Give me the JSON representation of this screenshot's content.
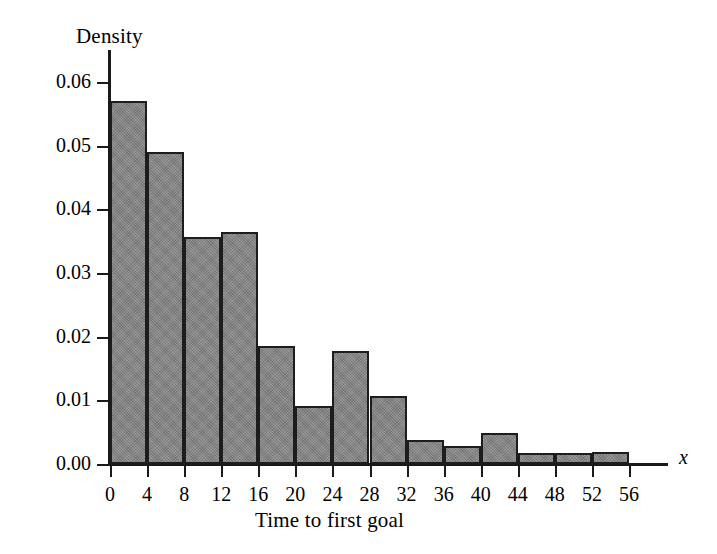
{
  "chart_data": {
    "type": "bar",
    "title": "",
    "xlabel": "Time to first goal",
    "ylabel": "Density",
    "x_axis_variable": "x",
    "bin_width": 4,
    "bin_edges": [
      0,
      4,
      8,
      12,
      16,
      20,
      24,
      28,
      32,
      36,
      40,
      44,
      48,
      52,
      56
    ],
    "categories": [
      "0-4",
      "4-8",
      "8-12",
      "12-16",
      "16-20",
      "20-24",
      "24-28",
      "28-32",
      "32-36",
      "36-40",
      "40-44",
      "44-48",
      "48-52",
      "52-56"
    ],
    "values": [
      0.057,
      0.049,
      0.0356,
      0.0364,
      0.0186,
      0.0091,
      0.0178,
      0.0107,
      0.0038,
      0.0028,
      0.0049,
      0.0017,
      0.0018,
      0.0019
    ],
    "xlim": [
      0,
      56
    ],
    "ylim": [
      0.0,
      0.06
    ],
    "xticks": [
      0,
      4,
      8,
      12,
      16,
      20,
      24,
      28,
      32,
      36,
      40,
      44,
      48,
      52,
      56
    ],
    "xticklabels": [
      "0",
      "4",
      "8",
      "12",
      "16",
      "20",
      "24",
      "28",
      "32",
      "36",
      "40",
      "44",
      "48",
      "52",
      "56"
    ],
    "yticks": [
      0.0,
      0.01,
      0.02,
      0.03,
      0.04,
      0.05,
      0.06
    ],
    "yticklabels": [
      "0.00",
      "0.01",
      "0.02",
      "0.03",
      "0.04",
      "0.05",
      "0.06"
    ],
    "grid": false,
    "legend": null,
    "bar_fill_color": "#828282",
    "bar_edge_color": "#1d1d1d",
    "axis_color": "#1a1a1a",
    "background_color": "#ffffff"
  }
}
